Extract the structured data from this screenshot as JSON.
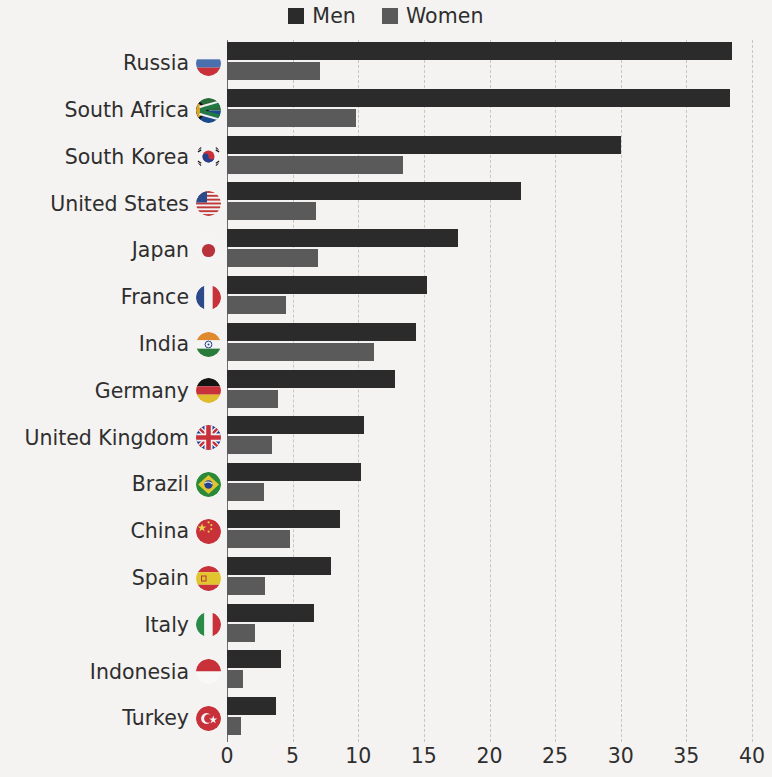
{
  "chart_data": {
    "type": "bar",
    "orientation": "horizontal",
    "title": "",
    "subtitle": "",
    "xlabel": "",
    "ylabel": "",
    "xlim": [
      0,
      40
    ],
    "xticks": [
      0,
      5,
      10,
      15,
      20,
      25,
      30,
      35,
      40
    ],
    "xtick_labels": [
      "0",
      "5",
      "10",
      "15",
      "20",
      "25",
      "30",
      "35",
      "40"
    ],
    "grid": true,
    "grid_axis": "x",
    "legend_position": "top-center",
    "categories": [
      "Russia",
      "South Africa",
      "South Korea",
      "United States",
      "Japan",
      "France",
      "India",
      "Germany",
      "United Kingdom",
      "Brazil",
      "China",
      "Spain",
      "Italy",
      "Indonesia",
      "Turkey"
    ],
    "series": [
      {
        "name": "Men",
        "color": "#2b2b2b",
        "values": [
          38.5,
          38.3,
          30.0,
          22.4,
          17.6,
          15.2,
          14.4,
          12.8,
          10.4,
          10.2,
          8.6,
          7.9,
          6.6,
          4.1,
          3.7
        ]
      },
      {
        "name": "Women",
        "color": "#5a5a5a",
        "values": [
          7.1,
          9.8,
          13.4,
          6.8,
          6.9,
          4.5,
          11.2,
          3.9,
          3.4,
          2.8,
          4.8,
          2.9,
          2.1,
          1.2,
          1.1
        ]
      }
    ]
  },
  "legend": {
    "entries": [
      {
        "label": "Men",
        "color": "#2b2b2b"
      },
      {
        "label": "Women",
        "color": "#5a5a5a"
      }
    ]
  },
  "flags": [
    {
      "country": "Russia",
      "icon": "flag-icon-russia"
    },
    {
      "country": "South Africa",
      "icon": "flag-icon-south-africa"
    },
    {
      "country": "South Korea",
      "icon": "flag-icon-south-korea"
    },
    {
      "country": "United States",
      "icon": "flag-icon-united-states"
    },
    {
      "country": "Japan",
      "icon": "flag-icon-japan"
    },
    {
      "country": "France",
      "icon": "flag-icon-france"
    },
    {
      "country": "India",
      "icon": "flag-icon-india"
    },
    {
      "country": "Germany",
      "icon": "flag-icon-germany"
    },
    {
      "country": "United Kingdom",
      "icon": "flag-icon-united-kingdom"
    },
    {
      "country": "Brazil",
      "icon": "flag-icon-brazil"
    },
    {
      "country": "China",
      "icon": "flag-icon-china"
    },
    {
      "country": "Spain",
      "icon": "flag-icon-spain"
    },
    {
      "country": "Italy",
      "icon": "flag-icon-italy"
    },
    {
      "country": "Indonesia",
      "icon": "flag-icon-indonesia"
    },
    {
      "country": "Turkey",
      "icon": "flag-icon-turkey"
    }
  ],
  "colors": {
    "background": "#f4f3f1",
    "men": "#2b2b2b",
    "women": "#5a5a5a",
    "gridline": "#c8c6c3",
    "axis": "#6f6d6b",
    "text": "#2e2e2e"
  }
}
